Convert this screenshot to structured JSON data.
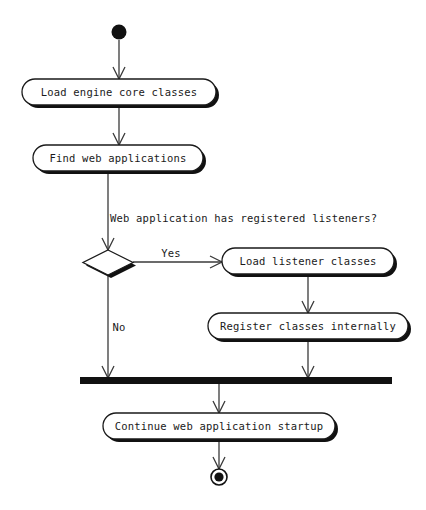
{
  "diagram": {
    "type": "uml-activity-diagram",
    "background_color": "#ffffff",
    "line_color": "#3a3a3a",
    "shape_stroke_color": "#1a1a1a",
    "shape_fill_color": "#ffffff",
    "shadow_color": "#111111",
    "text_color": "#1a1a1a",
    "nodes": {
      "start": {
        "kind": "initial-node",
        "label": ""
      },
      "action_1": {
        "kind": "action",
        "label": "Load engine core classes"
      },
      "action_2": {
        "kind": "action",
        "label": "Find web applications"
      },
      "decision": {
        "kind": "decision",
        "label": ""
      },
      "action_3": {
        "kind": "action",
        "label": "Load listener classes"
      },
      "action_4": {
        "kind": "action",
        "label": "Register classes internally"
      },
      "join": {
        "kind": "join-bar",
        "label": ""
      },
      "action_5": {
        "kind": "action",
        "label": "Continue web application startup"
      },
      "end": {
        "kind": "final-node",
        "label": ""
      }
    },
    "edges": {
      "guard_question": "Web application has registered listeners?",
      "branch_yes": "Yes",
      "branch_no": "No"
    }
  }
}
